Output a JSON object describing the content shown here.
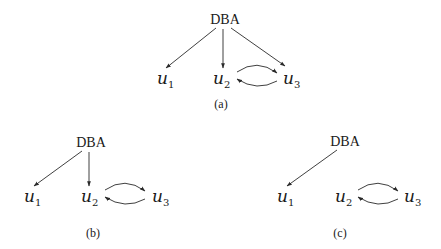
{
  "diagrams": [
    {
      "id": "a",
      "caption": "(a)",
      "root": "DBA",
      "users": [
        {
          "base": "u",
          "sub": "1"
        },
        {
          "base": "u",
          "sub": "2"
        },
        {
          "base": "u",
          "sub": "3"
        }
      ],
      "edges": [
        "DBA→u1",
        "DBA→u2",
        "DBA→u3",
        "u2→u3",
        "u3→u2"
      ]
    },
    {
      "id": "b",
      "caption": "(b)",
      "root": "DBA",
      "users": [
        {
          "base": "u",
          "sub": "1"
        },
        {
          "base": "u",
          "sub": "2"
        },
        {
          "base": "u",
          "sub": "3"
        }
      ],
      "edges": [
        "DBA→u1",
        "DBA→u2",
        "u2→u3",
        "u3→u2"
      ]
    },
    {
      "id": "c",
      "caption": "(c)",
      "root": "DBA",
      "users": [
        {
          "base": "u",
          "sub": "1"
        },
        {
          "base": "u",
          "sub": "2"
        },
        {
          "base": "u",
          "sub": "3"
        }
      ],
      "edges": [
        "DBA→u1",
        "u2→u3",
        "u3→u2"
      ]
    }
  ]
}
